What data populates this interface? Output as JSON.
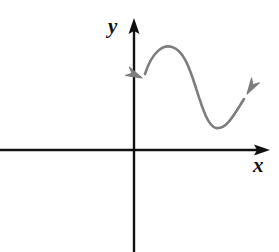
{
  "figure": {
    "background_color": "#ffffff",
    "width": 279,
    "height": 252
  },
  "axes": {
    "color": "#111111",
    "line_width": 2,
    "x_axis": {
      "label": "x",
      "label_x": 253,
      "label_y": 155,
      "start_x": 0,
      "end_x": 270,
      "y": 150,
      "arrowhead": "right",
      "arrow_tip_x": 270
    },
    "y_axis": {
      "label": "y",
      "label_x": 108,
      "label_y": 16,
      "x": 134,
      "start_y": 252,
      "end_y": 18,
      "arrowhead": "up",
      "arrow_tip_y": 18
    },
    "origin": {
      "x": 134,
      "y": 150
    }
  },
  "curve": {
    "name": "s-curve",
    "color": "#7d7d7d",
    "line_width": 2.6,
    "shape": "cubic",
    "path": "M 145 74 C 152 52, 163 44, 172 47 C 183 50, 189 66, 196 88 C 203 110, 208 126, 216 128 C 226 130, 234 115, 244 99",
    "arrowheads": [
      {
        "name": "left-arrowhead",
        "tip_x": 142,
        "tip_y": 78,
        "angle_deg": 205,
        "direction": "down-left"
      },
      {
        "name": "right-arrowhead",
        "tip_x": 247,
        "tip_y": 94,
        "angle_deg": -58,
        "direction": "up-right"
      }
    ],
    "local_maximum": {
      "x": 170,
      "y": 46
    },
    "local_minimum": {
      "x": 215,
      "y": 128
    }
  },
  "chart_data": {
    "type": "line",
    "title": "",
    "xlabel": "x",
    "ylabel": "y",
    "grid": false,
    "legend": null,
    "annotations": [],
    "axis_ranges": {
      "x": [
        -134,
        136
      ],
      "y": [
        -102,
        132
      ]
    },
    "series": [
      {
        "name": "s-curve",
        "color": "#7d7d7d",
        "points_pixel": [
          [
            145,
            74
          ],
          [
            152,
            58
          ],
          [
            160,
            49
          ],
          [
            170,
            46
          ],
          [
            180,
            54
          ],
          [
            188,
            68
          ],
          [
            196,
            88
          ],
          [
            204,
            110
          ],
          [
            210,
            123
          ],
          [
            216,
            128
          ],
          [
            224,
            126
          ],
          [
            232,
            115
          ],
          [
            244,
            99
          ]
        ],
        "points_graph": [
          [
            11,
            76
          ],
          [
            18,
            92
          ],
          [
            26,
            101
          ],
          [
            36,
            104
          ],
          [
            46,
            96
          ],
          [
            54,
            82
          ],
          [
            62,
            62
          ],
          [
            70,
            40
          ],
          [
            76,
            27
          ],
          [
            82,
            22
          ],
          [
            90,
            24
          ],
          [
            98,
            35
          ],
          [
            110,
            51
          ]
        ]
      }
    ]
  }
}
